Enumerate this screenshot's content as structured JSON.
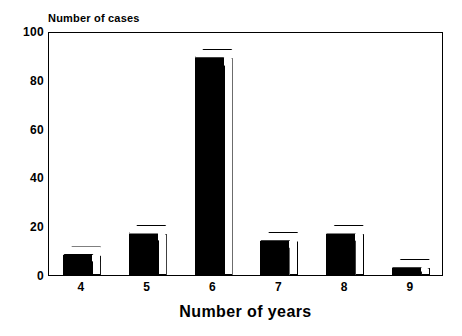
{
  "chart_data": {
    "type": "bar",
    "title": "",
    "categories": [
      "4",
      "5",
      "6",
      "7",
      "8",
      "9"
    ],
    "values": [
      8,
      17,
      89,
      14,
      17,
      3
    ],
    "series": [
      {
        "name": "Number of cases",
        "values": [
          8,
          17,
          89,
          14,
          17,
          3
        ]
      }
    ],
    "xlabel": "Number of years",
    "ylabel": "Number of cases",
    "ylim": [
      0,
      100
    ],
    "yticks": [
      0,
      20,
      40,
      60,
      80,
      100
    ],
    "ytick_labels": [
      "0",
      "20",
      "40",
      "60",
      "80",
      "100"
    ],
    "xtick_labels": [
      "4",
      "5",
      "6",
      "7",
      "8",
      "9"
    ],
    "grid": false,
    "legend": null,
    "bar_style": {
      "fill": "#000000",
      "edge": "#000000",
      "top_face": "#ffffff",
      "side_face": "#ffffff",
      "three_d": true
    },
    "background": "#ffffff",
    "frame": "#000000"
  },
  "axis": {
    "y_title": "Number of cases",
    "x_title": "Number of years"
  }
}
